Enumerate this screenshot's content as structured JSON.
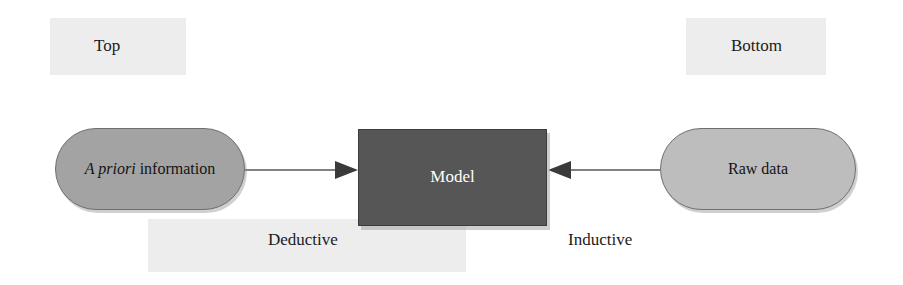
{
  "diagram": {
    "background_color": "#ffffff",
    "nodes": [
      {
        "id": "apriori",
        "label_italic": "A priori",
        "label_rest": " information",
        "full_label": "A priori information",
        "shape": "stadium",
        "fill_color": "#a3a3a3",
        "border_color": "#6f6f6f",
        "text_color": "#131313"
      },
      {
        "id": "model",
        "label": "Model",
        "shape": "rectangle",
        "fill_color": "#565656",
        "border_color": "#3c3c3c",
        "text_color": "#ffffff"
      },
      {
        "id": "rawdata",
        "label": "Raw data",
        "shape": "stadium",
        "fill_color": "#bdbdbd",
        "border_color": "#6f6f6f",
        "text_color": "#131313"
      }
    ],
    "edges": [
      {
        "id": "deductive",
        "label": "Deductive",
        "from": "apriori",
        "to": "model",
        "direction": "right",
        "arrowhead": "solid-triangle",
        "line_color": "#575757"
      },
      {
        "id": "inductive",
        "label": "Inductive",
        "from": "rawdata",
        "to": "model",
        "direction": "left",
        "arrowhead": "solid-triangle",
        "line_color": "#575757"
      }
    ],
    "captions": {
      "top": "Top",
      "bottom": "Bottom",
      "deductive": "Deductive",
      "inductive": "Inductive"
    },
    "highlight_color": "#ededed"
  }
}
